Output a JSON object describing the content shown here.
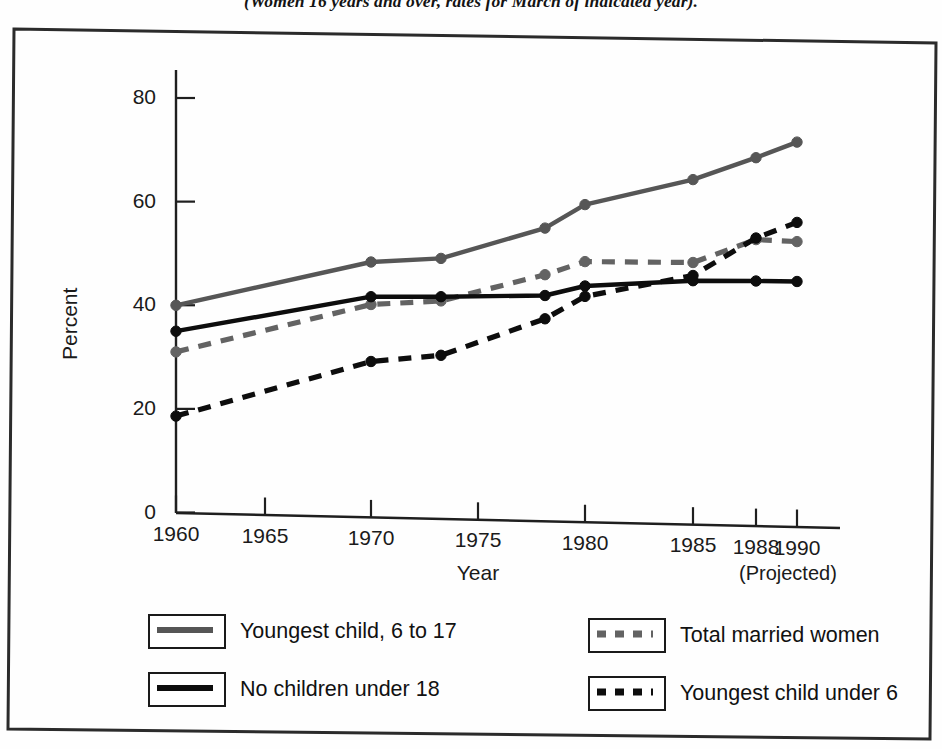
{
  "caption": "(Women 16 years and over, rates for March of indicated year).",
  "chart_data": {
    "type": "line",
    "title": "",
    "subtitle": "(Women 16 years and over, rates for March of indicated year).",
    "xlabel": "Year",
    "ylabel": "Percent",
    "xlim": [
      1960,
      1990
    ],
    "ylim": [
      0,
      88
    ],
    "grid": false,
    "legend_position": "bottom",
    "x_ticks": [
      1960,
      1965,
      1970,
      1975,
      1980,
      1985,
      1988,
      1990
    ],
    "x_tick_labels": [
      "1960",
      "1965",
      "1970",
      "1975",
      "1980",
      "1985",
      "1988",
      "1990"
    ],
    "y_ticks": [
      0,
      20,
      40,
      60,
      80
    ],
    "y_tick_labels": [
      "0",
      "20",
      "40",
      "60",
      "80"
    ],
    "annotations": [
      {
        "text": "(Projected)",
        "near_x": 1990
      }
    ],
    "x": [
      1960,
      1970,
      1973,
      1978,
      1980,
      1985,
      1988,
      1990
    ],
    "series": [
      {
        "name": "Youngest child, 6 to 17",
        "style": "solid",
        "color": "#565656",
        "values": [
          40.0,
          49.2,
          50.2,
          56.5,
          61.2,
          66.5,
          71.0,
          74.2
        ]
      },
      {
        "name": "Total married women",
        "style": "dashed",
        "color": "#636363",
        "values": [
          31.0,
          41.0,
          42.0,
          47.5,
          50.2,
          50.5,
          55.2,
          55.0
        ]
      },
      {
        "name": "No children under 18",
        "style": "solid",
        "color": "#0d0d0d",
        "values": [
          35.0,
          42.5,
          42.8,
          43.5,
          45.5,
          47.0,
          47.2,
          47.3
        ]
      },
      {
        "name": "Youngest child under 6",
        "style": "dashed",
        "color": "#0d0d0d",
        "values": [
          18.6,
          30.0,
          31.5,
          39.0,
          43.5,
          48.0,
          55.5,
          58.7
        ]
      }
    ]
  },
  "legend": {
    "entries": [
      {
        "label": "Youngest child, 6 to 17",
        "style": "solid",
        "color": "#565656"
      },
      {
        "label": "Total married women",
        "style": "dashed",
        "color": "#636363"
      },
      {
        "label": "No children under 18",
        "style": "solid",
        "color": "#0d0d0d"
      },
      {
        "label": "Youngest child under 6",
        "style": "dashed",
        "color": "#0d0d0d"
      }
    ]
  }
}
